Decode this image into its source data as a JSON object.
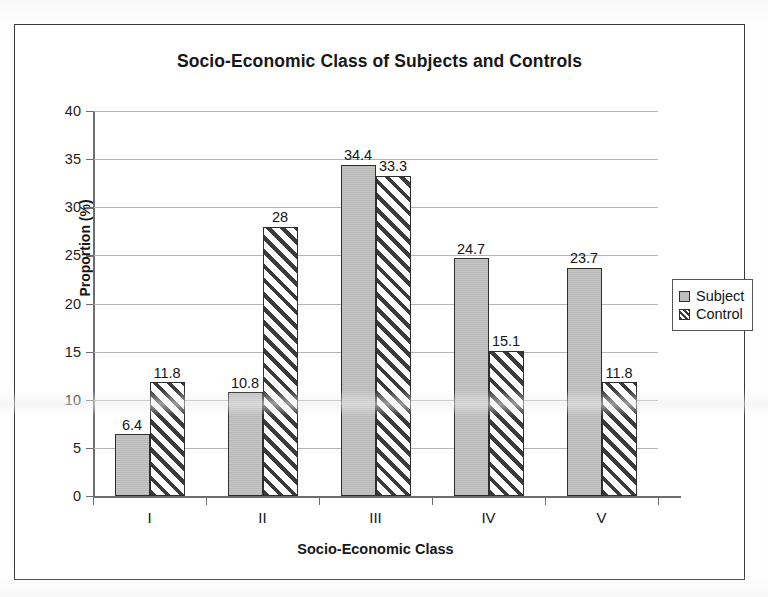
{
  "chart_data": {
    "type": "bar",
    "title": "Socio-Economic Class of Subjects and Controls",
    "xlabel": "Socio-Economic Class",
    "ylabel": "Proportion (%)",
    "categories": [
      "I",
      "II",
      "III",
      "IV",
      "V"
    ],
    "series": [
      {
        "name": "Subject",
        "values": [
          6.4,
          10.8,
          34.4,
          24.7,
          23.7
        ],
        "fill": "solid-gray",
        "color": "#c3c3c3"
      },
      {
        "name": "Control",
        "values": [
          11.8,
          28,
          33.3,
          15.1,
          11.8
        ],
        "fill": "diagonal-hatch",
        "color": "#ffffff"
      }
    ],
    "ylim": [
      0,
      40
    ],
    "yticks": [
      0,
      5,
      10,
      15,
      20,
      25,
      30,
      35,
      40
    ],
    "ytick_labels": [
      "0",
      "5",
      "10",
      "15",
      "20",
      "25",
      "30",
      "35",
      "40"
    ],
    "data_labels": [
      {
        "category": "I",
        "series": "Subject",
        "text": "6.4"
      },
      {
        "category": "I",
        "series": "Control",
        "text": "11.8"
      },
      {
        "category": "II",
        "series": "Subject",
        "text": "10.8"
      },
      {
        "category": "II",
        "series": "Control",
        "text": "28"
      },
      {
        "category": "III",
        "series": "Subject",
        "text": "34.4"
      },
      {
        "category": "III",
        "series": "Control",
        "text": "33.3"
      },
      {
        "category": "IV",
        "series": "Subject",
        "text": "24.7"
      },
      {
        "category": "IV",
        "series": "Control",
        "text": "15.1"
      },
      {
        "category": "V",
        "series": "Subject",
        "text": "23.7"
      },
      {
        "category": "V",
        "series": "Control",
        "text": "11.8"
      }
    ],
    "grid": true,
    "grid_axis": "y",
    "legend_position": "right",
    "legend_entries": [
      "Subject",
      "Control"
    ],
    "border_color": "#3a3a3a",
    "gridline_color": "#b4b4b4",
    "axis_color": "#6e6e6e"
  }
}
